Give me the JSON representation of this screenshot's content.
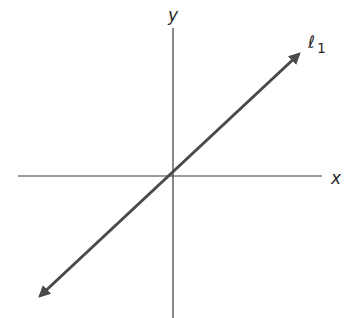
{
  "diagram": {
    "type": "coordinate-plane",
    "axes": {
      "x_label": "x",
      "y_label": "y"
    },
    "line": {
      "label": "ℓ",
      "subscript": "1",
      "description": "straight line through the origin with positive slope, arrows on both ends"
    },
    "colors": {
      "axis": "#3a3a3a",
      "line": "#4a4a4a",
      "background": "#ffffff"
    }
  }
}
